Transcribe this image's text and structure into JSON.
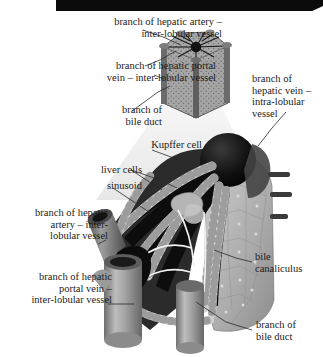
{
  "figure": {
    "background_color": "#ffffff",
    "header_bar_color": "#0a0a0a",
    "ink_color": "#1b1b1b"
  },
  "labels": [
    {
      "id": "hepatic-artery-inter",
      "text": "branch of hepatic artery –\ninter-lobular vessel",
      "align": "right"
    },
    {
      "id": "hepatic-portal-vein-inter",
      "text": "branch of hepatic portal\nvein – inter-lobular vessel",
      "align": "right"
    },
    {
      "id": "bile-duct-top",
      "text": "branch of\nbile duct",
      "align": "right"
    },
    {
      "id": "hepatic-vein-intra",
      "text": "branch of\nhepatic vein –\nintra-lobular\nvessel",
      "align": "left"
    },
    {
      "id": "kupffer-cell",
      "text": "Kupffer cell",
      "align": "right"
    },
    {
      "id": "liver-cells",
      "text": "liver cells",
      "align": "right"
    },
    {
      "id": "sinusoid",
      "text": "sinusoid",
      "align": "right"
    },
    {
      "id": "hepatic-artery-inter-low",
      "text": "branch of hepatic\nartery – inter-\nlobular vessel",
      "align": "right"
    },
    {
      "id": "hepatic-portal-vein-low",
      "text": "branch of hepatic\nportal vein –\ninter-lobular vessel",
      "align": "right"
    },
    {
      "id": "bile-canaliculus",
      "text": "bile\ncanaliculus",
      "align": "left"
    },
    {
      "id": "bile-duct-bottom",
      "text": "branch of\nbile duct",
      "align": "left"
    }
  ],
  "label_text": {
    "hepatic_artery_inter": "branch of hepatic artery –\ninter-lobular vessel",
    "hepatic_portal_vein_inter": "branch of hepatic portal\nvein – inter-lobular vessel",
    "bile_duct_top": "branch of\nbile duct",
    "hepatic_vein_intra": "branch of\nhepatic vein –\nintra-lobular\nvessel",
    "kupffer_cell": "Kupffer cell",
    "liver_cells": "liver cells",
    "sinusoid": "sinusoid",
    "hepatic_artery_inter_low": "branch of hepatic\nartery – inter-\nlobular vessel",
    "hepatic_portal_vein_low": "branch of hepatic\nportal vein –\ninter-lobular vessel",
    "bile_canaliculus": "bile\ncanaliculus",
    "bile_duct_bottom": "branch of\nbile duct"
  },
  "illustration": {
    "small_lobule": {
      "name": "hexagonal-liver-lobule",
      "description": "small hexagonal prism of liver tissue with radiating dark vessels at top and vertical corner vessels",
      "fill": "#9a9a9a",
      "stroke": "#3a3a3a"
    },
    "magnifier_cone": {
      "name": "magnification-cone",
      "fill": "#ececec"
    },
    "main_wedge": {
      "name": "liver-lobule-cutaway",
      "description": "enlarged cut-away wedge of lobule showing central vein, sinusoids, liver cell cords and bile canaliculi",
      "central_vein_fill": "#121212",
      "sinusoid_fill": "#101010",
      "cell_fill": "#d8d8d8",
      "vessel_fill": "#8e8e8e",
      "tissue_fill": "#b9b9b9"
    },
    "leader_line_color": "#2a2a2a"
  }
}
